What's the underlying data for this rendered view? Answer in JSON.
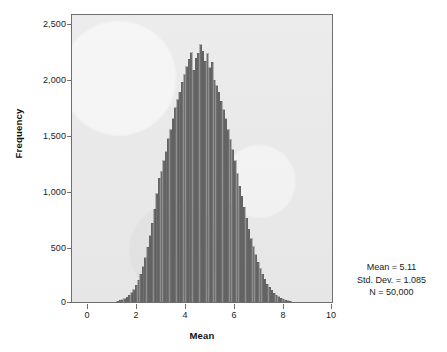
{
  "chart_data": {
    "type": "bar",
    "title": "",
    "subtitle": "",
    "xlabel": "Mean",
    "ylabel": "Frequency",
    "xlim": [
      -0.65,
      10.65
    ],
    "ylim": [
      0,
      2600
    ],
    "grid": false,
    "legend": null,
    "x_ticks": [
      "0",
      "2",
      "4",
      "6",
      "8",
      "10"
    ],
    "x_tick_values": [
      0,
      2,
      4,
      6,
      8,
      10
    ],
    "y_ticks": [
      "0",
      "500",
      "1,000",
      "1,500",
      "2,000",
      "2,500"
    ],
    "y_tick_values": [
      0,
      500,
      1000,
      1500,
      2000,
      2500
    ],
    "bin_width": 0.1,
    "bar_color": "#6f6f6f",
    "panel_color": "#e9e9e9",
    "annotations": [
      "Mean = 5.11",
      "Std. Dev. = 1.085",
      "N = 50,000"
    ],
    "x": [
      1.35,
      1.45,
      1.55,
      1.65,
      1.75,
      1.85,
      1.95,
      2.05,
      2.15,
      2.25,
      2.35,
      2.45,
      2.55,
      2.65,
      2.75,
      2.85,
      2.95,
      3.05,
      3.15,
      3.25,
      3.35,
      3.45,
      3.55,
      3.65,
      3.75,
      3.85,
      3.95,
      4.05,
      4.15,
      4.25,
      4.35,
      4.45,
      4.55,
      4.65,
      4.75,
      4.85,
      4.95,
      5.05,
      5.15,
      5.25,
      5.35,
      5.45,
      5.55,
      5.65,
      5.75,
      5.85,
      5.95,
      6.05,
      6.15,
      6.25,
      6.35,
      6.45,
      6.55,
      6.65,
      6.75,
      6.85,
      6.95,
      7.05,
      7.15,
      7.25,
      7.35,
      7.45,
      7.55,
      7.65,
      7.75,
      7.85,
      7.95,
      8.05,
      8.15,
      8.25,
      8.35,
      8.45,
      8.55,
      8.65,
      8.75,
      8.85
    ],
    "values": [
      8,
      14,
      22,
      30,
      44,
      62,
      84,
      112,
      150,
      196,
      250,
      320,
      400,
      496,
      600,
      715,
      840,
      980,
      1120,
      1180,
      1280,
      1360,
      1480,
      1560,
      1660,
      1760,
      1830,
      1900,
      1990,
      2060,
      2130,
      2200,
      2260,
      2100,
      2210,
      2255,
      2330,
      2270,
      2180,
      2250,
      2120,
      2170,
      2010,
      1960,
      1900,
      1820,
      1740,
      1660,
      1560,
      1470,
      1380,
      1280,
      1160,
      1050,
      960,
      860,
      760,
      660,
      575,
      500,
      430,
      360,
      300,
      250,
      205,
      160,
      135,
      105,
      80,
      62,
      46,
      34,
      24,
      18,
      12,
      7
    ]
  },
  "figure": {
    "x_axis_title": "Mean",
    "y_axis_title": "Frequency"
  }
}
